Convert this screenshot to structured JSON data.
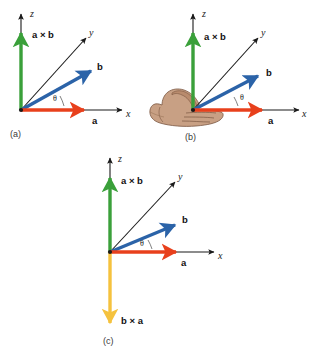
{
  "figure": {
    "background": "#ffffff",
    "colors": {
      "axis": "#1a1a1a",
      "vector_a": "#e8401c",
      "vector_b": "#2b63a8",
      "a_cross_b": "#3aa03a",
      "b_cross_a": "#f5c23e",
      "hand_fill": "#c49a7e",
      "hand_stroke": "#7a5640",
      "text": "#111111",
      "caption": "#3a3a3a"
    }
  },
  "panels": [
    {
      "id": "panel-a",
      "caption": "(a)",
      "axes": [
        {
          "name": "z-axis",
          "label": "z"
        },
        {
          "name": "y-axis",
          "label": "y"
        },
        {
          "name": "x-axis",
          "label": "x"
        }
      ],
      "vectors": [
        {
          "name": "a-cross-b-vector",
          "label": "a × b",
          "color": "#3aa03a",
          "direction": "up-z"
        },
        {
          "name": "b-vector",
          "label": "b",
          "color": "#2b63a8",
          "direction": "upper-right"
        },
        {
          "name": "a-vector",
          "label": "a",
          "color": "#e8401c",
          "direction": "right-x"
        }
      ],
      "angle": {
        "name": "theta-angle",
        "label": "θ"
      },
      "has_hand": false
    },
    {
      "id": "panel-b",
      "caption": "(b)",
      "axes": [
        {
          "name": "z-axis",
          "label": "z"
        },
        {
          "name": "y-axis",
          "label": "y"
        },
        {
          "name": "x-axis",
          "label": "x"
        }
      ],
      "vectors": [
        {
          "name": "a-cross-b-vector",
          "label": "a × b",
          "color": "#3aa03a",
          "direction": "up-z"
        },
        {
          "name": "b-vector",
          "label": "b",
          "color": "#2b63a8",
          "direction": "upper-right"
        },
        {
          "name": "a-vector",
          "label": "a",
          "color": "#e8401c",
          "direction": "right-x"
        }
      ],
      "angle": {
        "name": "theta-angle",
        "label": "θ"
      },
      "has_hand": true
    },
    {
      "id": "panel-c",
      "caption": "(c)",
      "axes": [
        {
          "name": "z-axis",
          "label": "z"
        },
        {
          "name": "y-axis",
          "label": "y"
        },
        {
          "name": "x-axis",
          "label": "x"
        }
      ],
      "vectors": [
        {
          "name": "a-cross-b-vector",
          "label": "a × b",
          "color": "#3aa03a",
          "direction": "up-z"
        },
        {
          "name": "b-vector",
          "label": "b",
          "color": "#2b63a8",
          "direction": "upper-right"
        },
        {
          "name": "a-vector",
          "label": "a",
          "color": "#e8401c",
          "direction": "right-x"
        },
        {
          "name": "b-cross-a-vector",
          "label": "b × a",
          "color": "#f5c23e",
          "direction": "down-z"
        }
      ],
      "angle": {
        "name": "theta-angle",
        "label": "θ"
      },
      "has_hand": false
    }
  ]
}
